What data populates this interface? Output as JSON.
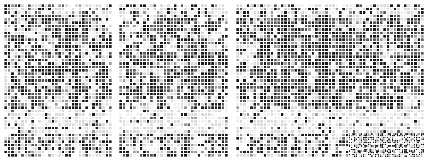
{
  "figure": {
    "width": 425,
    "height": 162,
    "background": "#ffffff",
    "panel_gap_px": 7
  },
  "palette": {
    "white": "#ffffff",
    "near_white": "#f2f2f2",
    "light_gray": "#d9d9d9",
    "mid_gray": "#9a9a9a",
    "dark_gray": "#5a5a5a",
    "black": "#1a1a1a",
    "gridline": "#ffffff"
  },
  "chart_data": {
    "type": "heatmap",
    "xlabel": "",
    "ylabel": "",
    "grid": true,
    "legend": "none",
    "colorscale": [
      "#ffffff",
      "#f2f2f2",
      "#d9d9d9",
      "#9a9a9a",
      "#5a5a5a",
      "#1a1a1a"
    ],
    "value_range": [
      0,
      5
    ],
    "panels": [
      {
        "name": "panel-left",
        "x": 4,
        "y": 4,
        "width": 108,
        "height": 153,
        "cols": 32,
        "rows": 45,
        "cell_px": 3.4,
        "seed": 1741,
        "bands": [
          {
            "rows": [
              0,
              2
            ],
            "density": 0.3,
            "style": "speckle"
          },
          {
            "rows": [
              3,
              30
            ],
            "density": 0.42,
            "style": "clustered"
          },
          {
            "rows": [
              31,
              37
            ],
            "density": 0.16,
            "style": "sparse"
          },
          {
            "rows": [
              38,
              44
            ],
            "density": 0.46,
            "style": "blocky"
          }
        ]
      },
      {
        "name": "panel-middle",
        "x": 119,
        "y": 4,
        "width": 109,
        "height": 153,
        "cols": 32,
        "rows": 45,
        "cell_px": 3.4,
        "seed": 5209,
        "bands": [
          {
            "rows": [
              0,
              2
            ],
            "density": 0.32,
            "style": "speckle"
          },
          {
            "rows": [
              3,
              30
            ],
            "density": 0.4,
            "style": "clustered"
          },
          {
            "rows": [
              31,
              37
            ],
            "density": 0.14,
            "style": "sparse"
          },
          {
            "rows": [
              38,
              44
            ],
            "density": 0.44,
            "style": "blocky"
          }
        ]
      },
      {
        "name": "panel-right",
        "x": 236,
        "y": 4,
        "width": 188,
        "height": 153,
        "cols": 55,
        "rows": 45,
        "cell_px": 3.4,
        "seed": 9127,
        "bands": [
          {
            "rows": [
              0,
              2
            ],
            "density": 0.32,
            "style": "speckle"
          },
          {
            "rows": [
              3,
              30
            ],
            "density": 0.44,
            "style": "striped"
          },
          {
            "rows": [
              31,
              37
            ],
            "density": 0.14,
            "style": "sparse"
          },
          {
            "rows": [
              38,
              44
            ],
            "density": 0.44,
            "style": "blocky"
          }
        ],
        "stripe_columns": [
          8,
          9,
          13,
          14,
          15,
          19,
          20,
          24,
          25,
          26
        ],
        "fine_region": {
          "col_start": 33,
          "row_start": 38,
          "note": "finer sub-cell texture bottom-right"
        }
      }
    ]
  }
}
